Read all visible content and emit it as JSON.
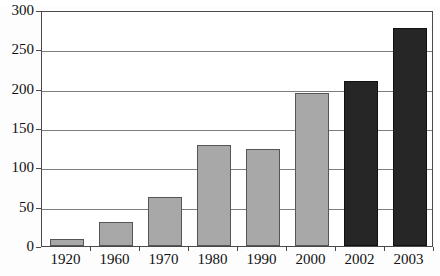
{
  "chart_data": {
    "type": "bar",
    "title": "",
    "xlabel": "",
    "ylabel": "",
    "categories": [
      "1920",
      "1960",
      "1970",
      "1980",
      "1990",
      "2000",
      "2002",
      "2003"
    ],
    "values": [
      9,
      30,
      62,
      128,
      123,
      195,
      210,
      277
    ],
    "bar_colors": [
      "#a8a8a8",
      "#a8a8a8",
      "#a8a8a8",
      "#a8a8a8",
      "#a8a8a8",
      "#a8a8a8",
      "#262626",
      "#262626"
    ],
    "ylim": [
      0,
      300
    ],
    "yticks": [
      0,
      50,
      100,
      150,
      200,
      250,
      300
    ],
    "ytick_labels": [
      "0",
      "50",
      "100",
      "150",
      "200",
      "250",
      "300"
    ],
    "grid": true,
    "legend": "none",
    "legend_position": "none",
    "series": [
      {
        "name": "",
        "values": [
          9,
          30,
          62,
          128,
          123,
          195,
          210,
          277
        ]
      }
    ]
  },
  "axis": {
    "y_min_label": "0",
    "y_max_label": "300",
    "tick_step": 50
  },
  "colors": {
    "bar_light": "#a8a8a8",
    "bar_dark": "#262626",
    "bar_light_border": "#555555",
    "bar_dark_border": "#111111",
    "gridline": "#7d7d7d",
    "frame": "#4a4a4a",
    "text": "#111111",
    "background": "#ffffff"
  }
}
